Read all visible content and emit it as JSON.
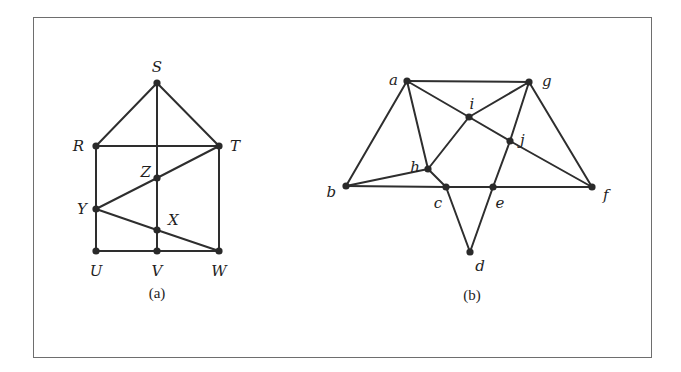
{
  "figure": {
    "frame_color": "#6e6e6e",
    "edge_color": "#2e2e2e",
    "node_color": "#2a2a2a",
    "graphs": [
      {
        "id": "a",
        "caption": "(a)",
        "caption_pos": [
          157,
          298
        ],
        "nodes": [
          {
            "id": "S",
            "label": "S",
            "x": 157,
            "y": 83,
            "lx": 157,
            "ly": 72,
            "anchor": "middle"
          },
          {
            "id": "R",
            "label": "R",
            "x": 96,
            "y": 146,
            "lx": 84,
            "ly": 151,
            "anchor": "end"
          },
          {
            "id": "T",
            "label": "T",
            "x": 219,
            "y": 146,
            "lx": 230,
            "ly": 151,
            "anchor": "start"
          },
          {
            "id": "Z",
            "label": "Z",
            "x": 157,
            "y": 178,
            "lx": 151,
            "ly": 177,
            "anchor": "end"
          },
          {
            "id": "Y",
            "label": "Y",
            "x": 96,
            "y": 209,
            "lx": 87,
            "ly": 214,
            "anchor": "end"
          },
          {
            "id": "X",
            "label": "X",
            "x": 157,
            "y": 230,
            "lx": 168,
            "ly": 225,
            "anchor": "start"
          },
          {
            "id": "U",
            "label": "U",
            "x": 96,
            "y": 251,
            "lx": 96,
            "ly": 276,
            "anchor": "middle"
          },
          {
            "id": "V",
            "label": "V",
            "x": 157,
            "y": 251,
            "lx": 157,
            "ly": 276,
            "anchor": "middle"
          },
          {
            "id": "W",
            "label": "W",
            "x": 219,
            "y": 251,
            "lx": 219,
            "ly": 276,
            "anchor": "middle"
          }
        ],
        "edges": [
          [
            "S",
            "R"
          ],
          [
            "S",
            "T"
          ],
          [
            "S",
            "Z"
          ],
          [
            "Z",
            "X"
          ],
          [
            "X",
            "V"
          ],
          [
            "R",
            "T"
          ],
          [
            "R",
            "Y"
          ],
          [
            "Y",
            "U"
          ],
          [
            "T",
            "W"
          ],
          [
            "T",
            "Z"
          ],
          [
            "Z",
            "Y"
          ],
          [
            "Y",
            "X"
          ],
          [
            "X",
            "W"
          ],
          [
            "U",
            "V"
          ],
          [
            "V",
            "W"
          ]
        ]
      },
      {
        "id": "b",
        "caption": "(b)",
        "caption_pos": [
          472,
          300
        ],
        "nodes": [
          {
            "id": "a",
            "label": "a",
            "x": 407,
            "y": 81,
            "lx": 398,
            "ly": 85,
            "anchor": "end"
          },
          {
            "id": "g",
            "label": "g",
            "x": 529,
            "y": 82,
            "lx": 542,
            "ly": 86,
            "anchor": "start"
          },
          {
            "id": "i",
            "label": "i",
            "x": 469,
            "y": 117,
            "lx": 472,
            "ly": 109,
            "anchor": "middle"
          },
          {
            "id": "h",
            "label": "h",
            "x": 428,
            "y": 169,
            "lx": 420,
            "ly": 172,
            "anchor": "end"
          },
          {
            "id": "j",
            "label": "j",
            "x": 510,
            "y": 141,
            "lx": 520,
            "ly": 145,
            "anchor": "start"
          },
          {
            "id": "b",
            "label": "b",
            "x": 346,
            "y": 186,
            "lx": 336,
            "ly": 197,
            "anchor": "end"
          },
          {
            "id": "c",
            "label": "c",
            "x": 446,
            "y": 187,
            "lx": 438,
            "ly": 208,
            "anchor": "middle"
          },
          {
            "id": "e",
            "label": "e",
            "x": 493,
            "y": 187,
            "lx": 500,
            "ly": 208,
            "anchor": "middle"
          },
          {
            "id": "f",
            "label": "f",
            "x": 592,
            "y": 187,
            "lx": 603,
            "ly": 200,
            "anchor": "start"
          },
          {
            "id": "d",
            "label": "d",
            "x": 470,
            "y": 252,
            "lx": 480,
            "ly": 271,
            "anchor": "middle"
          }
        ],
        "edges": [
          [
            "a",
            "g"
          ],
          [
            "a",
            "b"
          ],
          [
            "g",
            "f"
          ],
          [
            "a",
            "i"
          ],
          [
            "i",
            "j"
          ],
          [
            "j",
            "f"
          ],
          [
            "a",
            "h"
          ],
          [
            "h",
            "c"
          ],
          [
            "c",
            "d"
          ],
          [
            "g",
            "i"
          ],
          [
            "i",
            "h"
          ],
          [
            "h",
            "b"
          ],
          [
            "g",
            "j"
          ],
          [
            "j",
            "e"
          ],
          [
            "e",
            "d"
          ],
          [
            "b",
            "c"
          ],
          [
            "c",
            "e"
          ],
          [
            "e",
            "f"
          ]
        ]
      }
    ]
  }
}
